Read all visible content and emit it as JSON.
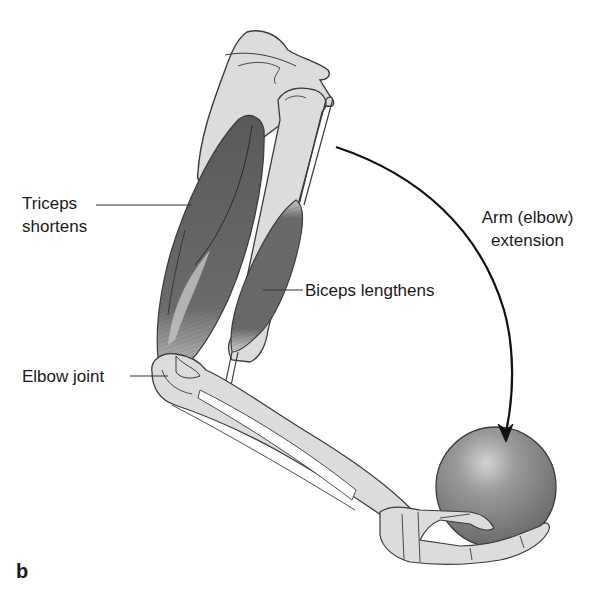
{
  "figure": {
    "panel_letter": "b",
    "labels": {
      "triceps_line1": "Triceps",
      "triceps_line2": "shortens",
      "biceps": "Biceps lengthens",
      "elbow_joint": "Elbow joint",
      "motion_line1": "Arm (elbow)",
      "motion_line2": "extension"
    },
    "colors": {
      "bone": "#dcdcdc",
      "bone_outline": "#3a3a3a",
      "muscle": "#6e6e6e",
      "muscle_dark": "#555555",
      "tendon": "#c8c8c8",
      "ball": "#8a8a8a",
      "ball_highlight": "#cfcfcf",
      "arrow": "#111111",
      "text": "#1a1a1a"
    }
  }
}
